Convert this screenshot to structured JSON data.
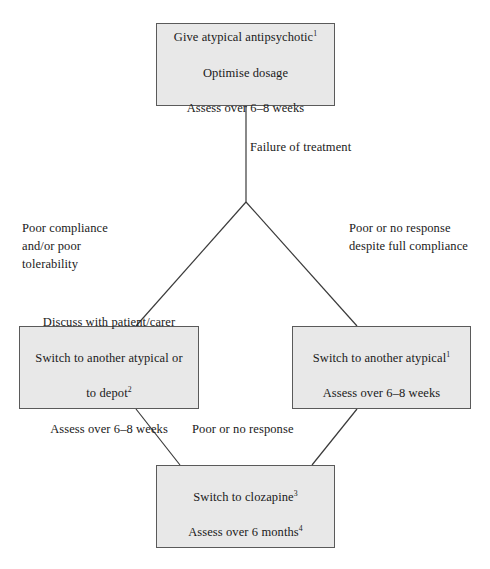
{
  "diagram": {
    "type": "flowchart",
    "colors": {
      "node_fill": "#e8e8e8",
      "node_border": "#5a5a5a",
      "edge_stroke": "#3a3a3a",
      "text": "#1a1a1a",
      "background": "#ffffff"
    },
    "nodes": [
      {
        "id": "start",
        "lines": [
          "Give atypical antipsychotic",
          "Optimise dosage",
          "Assess over 6–8 weeks"
        ],
        "superscript_line_1": "1",
        "text": "Give atypical antipsychotic1\nOptimise dosage\nAssess over 6–8 weeks"
      },
      {
        "id": "left",
        "lines": [
          "Discuss with patient/carer",
          "Switch to another atypical or",
          "to depot",
          "Assess over 6–8 weeks"
        ],
        "superscript_line_3": "2",
        "text": "Discuss with patient/carer\nSwitch to another atypical or\nto depot2\nAssess over 6–8 weeks"
      },
      {
        "id": "right",
        "lines": [
          "Switch to another atypical",
          "Assess over 6–8 weeks"
        ],
        "superscript_line_1": "1",
        "text": "Switch to another atypical1\nAssess over 6–8 weeks"
      },
      {
        "id": "clozapine",
        "lines": [
          "Switch to clozapine",
          "Assess over 6 months"
        ],
        "superscript_line_1": "3",
        "superscript_line_2": "4",
        "text": "Switch to clozapine3\nAssess over 6 months4"
      }
    ],
    "edge_labels": {
      "failure": "Failure of treatment",
      "poor_compliance": "Poor compliance\nand/or poor\ntolerability",
      "poor_response_right": "Poor or no response\ndespite full compliance",
      "poor_response_bottom": "Poor or no response"
    },
    "node_text": {
      "start_l1": "Give atypical antipsychotic",
      "start_l1_sup": "1",
      "start_l2": "Optimise dosage",
      "start_l3": "Assess over 6–8 weeks",
      "left_l1": "Discuss with patient/carer",
      "left_l2": "Switch to another atypical or",
      "left_l3": "to depot",
      "left_l3_sup": "2",
      "left_l4": "Assess over 6–8 weeks",
      "right_l1": "Switch to another atypical",
      "right_l1_sup": "1",
      "right_l2": "Assess over 6–8 weeks",
      "clz_l1": "Switch to clozapine",
      "clz_l1_sup": "3",
      "clz_l2": "Assess over 6 months",
      "clz_l2_sup": "4"
    }
  }
}
